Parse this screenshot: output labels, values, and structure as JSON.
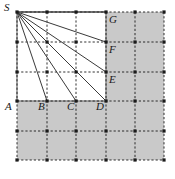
{
  "figure": {
    "caption": "",
    "colors": {
      "shade": "#c9c9c9",
      "line": "#3a3a3a",
      "grid": "#1a1a1a",
      "outline": "#8a8a8a",
      "label": "#1a1a1a",
      "background": "#ffffff"
    },
    "grid": {
      "columns": 5,
      "rows": 5,
      "x_nodes": [
        17,
        47,
        76,
        106,
        135,
        164
      ],
      "y_nodes": [
        12,
        42,
        72,
        101,
        131,
        160
      ],
      "node_marker": "square-dot",
      "line_style": "dashed"
    },
    "shaded_cells": [
      {
        "col": 3,
        "row": 0
      },
      {
        "col": 4,
        "row": 0
      },
      {
        "col": 3,
        "row": 1
      },
      {
        "col": 4,
        "row": 1
      },
      {
        "col": 3,
        "row": 2
      },
      {
        "col": 4,
        "row": 2
      },
      {
        "col": 0,
        "row": 3
      },
      {
        "col": 1,
        "row": 3
      },
      {
        "col": 2,
        "row": 3
      },
      {
        "col": 3,
        "row": 3
      },
      {
        "col": 4,
        "row": 3
      },
      {
        "col": 0,
        "row": 4
      },
      {
        "col": 1,
        "row": 4
      },
      {
        "col": 2,
        "row": 4
      },
      {
        "col": 3,
        "row": 4
      },
      {
        "col": 4,
        "row": 4
      }
    ],
    "solid_square": {
      "x1": 17,
      "y1": 12,
      "x2": 106,
      "y2": 101
    },
    "points": [
      {
        "id": "S",
        "label": "S",
        "x": 17,
        "y": 12,
        "lx": 4,
        "ly": 2
      },
      {
        "id": "A",
        "label": "A",
        "x": 17,
        "y": 101,
        "lx": 5,
        "ly": 101
      },
      {
        "id": "B",
        "label": "B",
        "x": 47,
        "y": 101,
        "lx": 38,
        "ly": 101
      },
      {
        "id": "C",
        "label": "C",
        "x": 76,
        "y": 101,
        "lx": 67,
        "ly": 101
      },
      {
        "id": "D",
        "label": "D",
        "x": 106,
        "y": 101,
        "lx": 96,
        "ly": 101
      },
      {
        "id": "E",
        "label": "E",
        "x": 106,
        "y": 72,
        "lx": 109,
        "ly": 74
      },
      {
        "id": "F",
        "label": "F",
        "x": 106,
        "y": 42,
        "lx": 109,
        "ly": 44
      },
      {
        "id": "G",
        "label": "G",
        "x": 106,
        "y": 12,
        "lx": 109,
        "ly": 14
      }
    ],
    "rays": [
      {
        "from": "S",
        "to": "B"
      },
      {
        "from": "S",
        "to": "C"
      },
      {
        "from": "S",
        "to": "D"
      },
      {
        "from": "S",
        "to": "E"
      },
      {
        "from": "S",
        "to": "F"
      },
      {
        "from": "S",
        "to": "G"
      }
    ]
  }
}
